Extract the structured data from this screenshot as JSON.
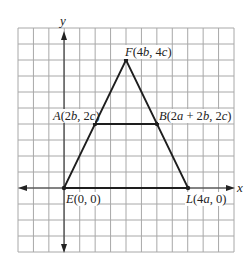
{
  "figure": {
    "type": "coordinate-geometry-diagram",
    "axes": {
      "x_label": "x",
      "y_label": "y"
    },
    "grid": {
      "columns": 14,
      "rows": 14,
      "line_color": "#aaaaaa"
    },
    "points": [
      {
        "id": "E",
        "label": "E(0, 0)",
        "name": "E",
        "coords": "(0, 0)"
      },
      {
        "id": "L",
        "label": "L(4a, 0)",
        "name": "L",
        "coords": "(4a, 0)"
      },
      {
        "id": "F",
        "label": "F(4b, 4c)",
        "name": "F",
        "coords": "(4b, 4c)"
      },
      {
        "id": "A",
        "label": "A(2b, 2c)",
        "name": "A",
        "coords": "(2b, 2c)"
      },
      {
        "id": "B",
        "label": "B(2a + 2b, 2c)",
        "name": "B",
        "coords": "(2a + 2b, 2c)"
      }
    ],
    "segments": [
      "EL",
      "EF",
      "LF",
      "AB"
    ],
    "colors": {
      "stroke": "#222222",
      "grid": "#a8a8a8",
      "background": "#ffffff"
    }
  }
}
